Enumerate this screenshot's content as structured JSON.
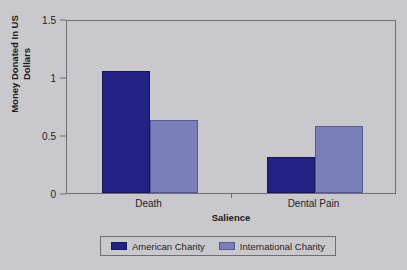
{
  "chart_data": {
    "type": "bar",
    "title": "",
    "subtitle": "",
    "xlabel": "Salience",
    "ylabel": "Money Donated In US Dollars",
    "ylabel_lines": [
      "Money Donated In US",
      "Dollars"
    ],
    "categories": [
      "Death",
      "Dental Pain"
    ],
    "series": [
      {
        "name": "American Charity",
        "color": "#222283",
        "values": [
          1.05,
          0.31
        ]
      },
      {
        "name": "International Charity",
        "color": "#7a7fba",
        "values": [
          0.63,
          0.58
        ]
      }
    ],
    "ylim": [
      0,
      1.5
    ],
    "yticks": [
      0,
      0.5,
      1,
      1.5
    ],
    "ytick_labels": [
      "0",
      "0.5",
      "1",
      "1.5"
    ],
    "grid": false,
    "legend_position": "bottom",
    "background_color": "#c9c9cd",
    "frame_color": "#6d6d75"
  },
  "legend": {
    "entries": [
      {
        "label": "American Charity"
      },
      {
        "label": "International Charity"
      }
    ]
  }
}
